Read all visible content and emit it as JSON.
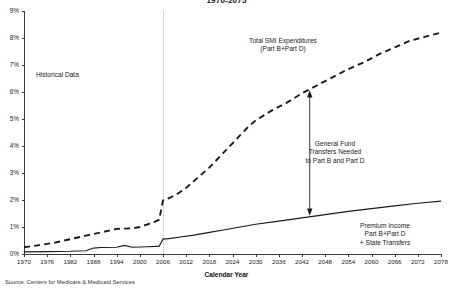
{
  "chart_data": {
    "type": "line",
    "title": "1970-2075",
    "xlabel": "Calendar Year",
    "ylabel": "",
    "xlim": [
      1970,
      2078
    ],
    "ylim": [
      0,
      9
    ],
    "grid": false,
    "legend_position": "inline-annotations",
    "ytick_labels": [
      "0%",
      "1%",
      "2%",
      "3%",
      "4%",
      "5%",
      "6%",
      "7%",
      "8%",
      "9%"
    ],
    "ytick_values": [
      0,
      1,
      2,
      3,
      4,
      5,
      6,
      7,
      8,
      9
    ],
    "xtick_labels": [
      "1970",
      "1976",
      "1982",
      "1988",
      "1994",
      "2000",
      "2006",
      "2012",
      "2018",
      "2024",
      "2030",
      "2036",
      "2042",
      "2048",
      "2054",
      "2060",
      "2066",
      "2072",
      "2078"
    ],
    "xtick_values": [
      1970,
      1976,
      1982,
      1988,
      1994,
      2000,
      2006,
      2012,
      2018,
      2024,
      2030,
      2036,
      2042,
      2048,
      2054,
      2060,
      2066,
      2072,
      2078
    ],
    "series": [
      {
        "name": "Total SMI Expenditures (Part B+Part D)",
        "style": "dashed",
        "color": "#1a1a1a",
        "x": [
          1970,
          1974,
          1978,
          1982,
          1986,
          1990,
          1994,
          1998,
          2000,
          2002,
          2004,
          2005,
          2006,
          2008,
          2010,
          2012,
          2014,
          2016,
          2018,
          2020,
          2022,
          2024,
          2026,
          2028,
          2030,
          2034,
          2038,
          2042,
          2046,
          2050,
          2054,
          2058,
          2062,
          2066,
          2070,
          2074,
          2078
        ],
        "values": [
          0.25,
          0.33,
          0.42,
          0.55,
          0.68,
          0.8,
          0.93,
          0.95,
          1.0,
          1.1,
          1.2,
          1.27,
          1.98,
          2.1,
          2.25,
          2.45,
          2.7,
          2.95,
          3.2,
          3.5,
          3.8,
          4.1,
          4.4,
          4.7,
          4.95,
          5.3,
          5.6,
          5.95,
          6.25,
          6.55,
          6.85,
          7.1,
          7.4,
          7.65,
          7.9,
          8.05,
          8.2
        ]
      },
      {
        "name": "Premium Income Part B+Part D + State Transfers",
        "style": "solid",
        "color": "#1a1a1a",
        "x": [
          1970,
          1976,
          1982,
          1986,
          1988,
          1990,
          1994,
          1996,
          1998,
          2000,
          2002,
          2004,
          2005,
          2006,
          2008,
          2010,
          2014,
          2018,
          2022,
          2026,
          2030,
          2036,
          2042,
          2048,
          2054,
          2060,
          2066,
          2072,
          2078
        ],
        "values": [
          0.08,
          0.09,
          0.1,
          0.12,
          0.22,
          0.24,
          0.25,
          0.32,
          0.25,
          0.26,
          0.27,
          0.28,
          0.29,
          0.55,
          0.58,
          0.62,
          0.7,
          0.8,
          0.9,
          1.0,
          1.1,
          1.22,
          1.34,
          1.46,
          1.58,
          1.68,
          1.78,
          1.88,
          1.96
        ]
      }
    ],
    "annotations": [
      {
        "name": "historical-data",
        "text": "Historical Data"
      },
      {
        "name": "total-smi-expenditures",
        "line1": "Total SMI Expenditures",
        "line2": "(Part B+Part D)"
      },
      {
        "name": "general-fund-transfers",
        "line1": "General Fund",
        "line2": "Transfers Needed",
        "line3": "to Part B and Part D"
      },
      {
        "name": "premium-income",
        "line1": "Premium Income",
        "line2": "Part B+Part D",
        "line3": "+ State Transfers"
      }
    ],
    "source": "Source: Centers for Medicare & Medicaid Services"
  }
}
